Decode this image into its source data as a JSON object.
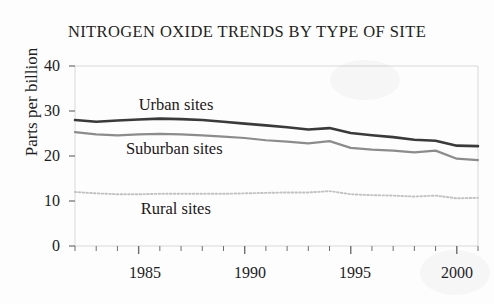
{
  "chart_data": {
    "type": "line",
    "title": "NITROGEN OXIDE TRENDS BY TYPE OF SITE",
    "xlabel": "",
    "ylabel": "Parts per billion",
    "ylim": [
      0,
      40
    ],
    "xlim": [
      1982,
      2001
    ],
    "ytick_labels": [
      "40",
      "30",
      "20",
      "10",
      "0"
    ],
    "ytick_values": [
      40,
      30,
      20,
      10,
      0
    ],
    "xtick_labels": [
      "1985",
      "1990",
      "1995",
      "2000"
    ],
    "xtick_values": [
      1985,
      1990,
      1995,
      2000
    ],
    "x_minor_ticks_every": 1,
    "grid": false,
    "legend_position": "inline-annotations",
    "x": [
      1982,
      1983,
      1984,
      1985,
      1986,
      1987,
      1988,
      1989,
      1990,
      1991,
      1992,
      1993,
      1994,
      1995,
      1996,
      1997,
      1998,
      1999,
      2000,
      2001
    ],
    "series": [
      {
        "name": "Urban sites",
        "color": "#3a3a3a",
        "style": "solid",
        "label_x": 1985.0,
        "label_y": 31.2,
        "values": [
          28.0,
          27.6,
          27.9,
          28.1,
          28.3,
          28.2,
          28.0,
          27.6,
          27.2,
          26.8,
          26.4,
          25.9,
          26.2,
          25.1,
          24.6,
          24.2,
          23.6,
          23.4,
          22.3,
          22.2
        ]
      },
      {
        "name": "Suburban sites",
        "color": "#8c8c8c",
        "style": "solid",
        "label_x": 1984.4,
        "label_y": 21.4,
        "values": [
          25.3,
          24.8,
          24.6,
          24.8,
          24.9,
          24.8,
          24.6,
          24.3,
          24.0,
          23.5,
          23.2,
          22.8,
          23.3,
          21.8,
          21.4,
          21.2,
          20.8,
          21.2,
          19.4,
          19.1
        ]
      },
      {
        "name": "Rural sites",
        "color": "#c2c2c2",
        "style": "dotted",
        "label_x": 1985.1,
        "label_y": 8.1,
        "values": [
          12.0,
          11.7,
          11.5,
          11.5,
          11.6,
          11.6,
          11.6,
          11.6,
          11.7,
          11.8,
          11.9,
          11.9,
          12.2,
          11.5,
          11.3,
          11.2,
          11.0,
          11.2,
          10.6,
          10.7
        ]
      }
    ]
  },
  "axes": {
    "frame_color": "#d9d9d9",
    "tick_color": "#6d6d6d"
  }
}
